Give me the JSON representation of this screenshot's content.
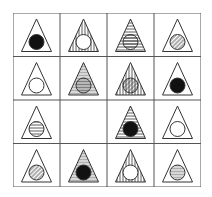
{
  "puzzle": {
    "rows": 4,
    "cols": 4,
    "colors": {
      "line": "#333333",
      "fill": "#111111",
      "background": "#ffffff",
      "grid": "#555555"
    },
    "cells": [
      [
        {
          "triangle": "none",
          "circle": "solid"
        },
        {
          "triangle": "vertical",
          "circle": "empty"
        },
        {
          "triangle": "horizontal",
          "circle": "horizontal"
        },
        {
          "triangle": "none",
          "circle": "diagonal"
        }
      ],
      [
        {
          "triangle": "none",
          "circle": "empty"
        },
        {
          "triangle": "horizontal",
          "circle": "horizontal"
        },
        {
          "triangle": "vertical",
          "circle": "diagonal"
        },
        {
          "triangle": "none",
          "circle": "solid"
        }
      ],
      [
        {
          "triangle": "none",
          "circle": "horizontal"
        },
        {
          "missing": true
        },
        {
          "triangle": "horizontal",
          "circle": "solid"
        },
        {
          "triangle": "none",
          "circle": "empty"
        }
      ],
      [
        {
          "triangle": "none",
          "circle": "diagonal"
        },
        {
          "triangle": "horizontal",
          "circle": "solid"
        },
        {
          "triangle": "vertical",
          "circle": "empty"
        },
        {
          "triangle": "none",
          "circle": "horizontal"
        }
      ]
    ]
  }
}
